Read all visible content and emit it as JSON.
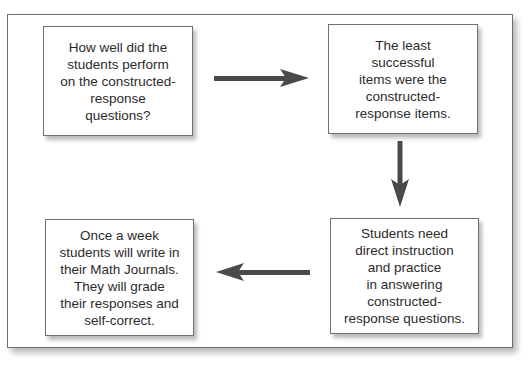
{
  "diagram": {
    "type": "flowchart",
    "boxes": [
      {
        "id": "box1",
        "text": "How well did the\nstudents perform\non the constructed-\nresponse\nquestions?"
      },
      {
        "id": "box2",
        "text": "The least\nsuccessful\nitems were the\nconstructed-\nresponse items."
      },
      {
        "id": "box3",
        "text": "Students need\ndirect instruction\nand practice\nin answering\nconstructed-\nresponse questions."
      },
      {
        "id": "box4",
        "text": "Once a week\nstudents will write in\ntheir Math Journals.\nThey will grade\ntheir responses and\nself-correct."
      }
    ],
    "arrows": [
      {
        "from": "box1",
        "to": "box2",
        "direction": "right"
      },
      {
        "from": "box2",
        "to": "box3",
        "direction": "down"
      },
      {
        "from": "box3",
        "to": "box4",
        "direction": "left"
      }
    ],
    "colors": {
      "arrow": "#4a4a4a",
      "border": "#707070",
      "background": "#ffffff"
    }
  }
}
